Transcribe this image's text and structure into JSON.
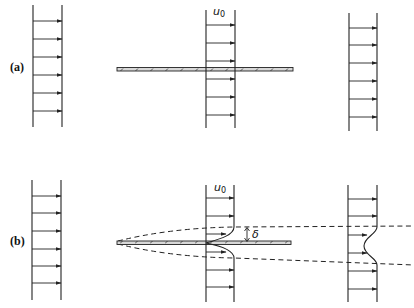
{
  "figure": {
    "panel_a": {
      "label": "(a)",
      "description": "Uniform flow approaching, passing over and leaving an ideal (inviscid) flat plate",
      "freestream_label": "u",
      "freestream_subscript": "0"
    },
    "panel_b": {
      "label": "(b)",
      "description": "Real fluid: boundary layer of thickness delta grows along the plate; velocity deficit in the wake",
      "freestream_label": "u",
      "freestream_subscript": "0",
      "thickness_label": "δ"
    },
    "colors": {
      "ink": "#222222",
      "plate_fill": "#d8d8d8",
      "background": "#ffffff"
    }
  }
}
